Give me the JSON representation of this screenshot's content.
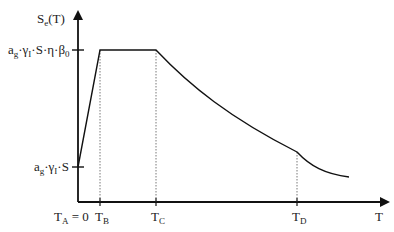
{
  "diagram": {
    "y_axis": {
      "label_main": "S",
      "label_sub": "e",
      "label_tail": "(T)"
    },
    "x_axis": {
      "label": "T"
    },
    "y_ticks": [
      {
        "id": "plateau",
        "text_parts": [
          "a",
          "g",
          "·γ",
          "I",
          "·S·η·β",
          "0"
        ]
      },
      {
        "id": "start",
        "text_parts": [
          "a",
          "g",
          "·γ",
          "I",
          "·S"
        ]
      }
    ],
    "x_ticks": [
      {
        "id": "TA",
        "main": "T",
        "sub": "A",
        "tail": " = 0"
      },
      {
        "id": "TB",
        "main": "T",
        "sub": "B",
        "tail": ""
      },
      {
        "id": "TC",
        "main": "T",
        "sub": "C",
        "tail": ""
      },
      {
        "id": "TD",
        "main": "T",
        "sub": "D",
        "tail": ""
      }
    ],
    "colors": {
      "line": "#111111",
      "guide": "#555555"
    }
  }
}
